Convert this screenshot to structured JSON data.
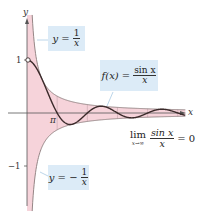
{
  "figure": {
    "axes": {
      "x_label": "x",
      "y_label": "y",
      "y_ticks": [
        {
          "value": 1,
          "label": "1"
        },
        {
          "value": -1,
          "label": "−1"
        }
      ],
      "x_ticks": [
        {
          "value": 3.14159,
          "label": "π"
        }
      ],
      "origin_px": [
        27,
        113
      ],
      "x_scale_px_per_unit": 9.6,
      "y_scale_px_per_unit": 53,
      "x_max": 16.5,
      "y_range": [
        -1.85,
        1.85
      ]
    },
    "curves": {
      "f": {
        "expr": "sin(x)/x",
        "color": "#3a2a2a"
      },
      "upper_envelope": {
        "expr": "1/x",
        "color": "#8a7a7a"
      },
      "lower_envelope": {
        "expr": "-1/x",
        "color": "#8a7a7a"
      },
      "fill_color": "#f6d3da"
    },
    "labels": {
      "upper": {
        "lhs": "y =",
        "num": "1",
        "den": "x"
      },
      "function": {
        "lhs": "f(x) =",
        "num": "sin x",
        "den": "x"
      },
      "lower": {
        "lhs": "y = −",
        "num": "1",
        "den": "x"
      },
      "limit": {
        "word": "lim",
        "sub": "x→∞",
        "num": "sin x",
        "den": "x",
        "rhs": "= 0"
      }
    },
    "colors": {
      "label_box": "#dcebf7",
      "axis": "#555555"
    }
  }
}
